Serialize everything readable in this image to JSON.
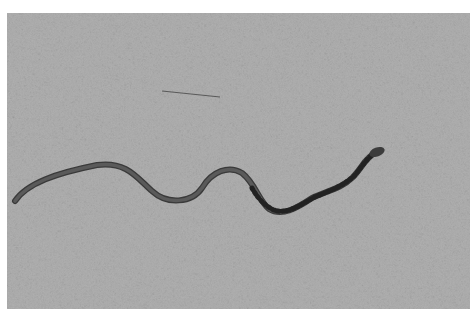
{
  "image": {
    "description": "Black-and-white photograph of a small snake slithering across coarse sand",
    "subject": "snake",
    "background": "sand",
    "colors": {
      "border": "#ffffff",
      "sand": "#a8a8a8",
      "snake_body": "#4a4a4a",
      "snake_pattern": "#2a2a2a"
    }
  }
}
